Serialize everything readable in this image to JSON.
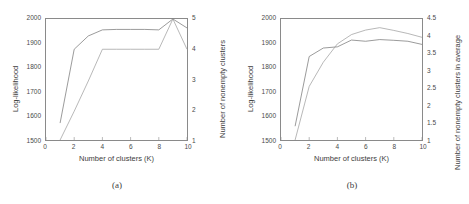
{
  "figure": {
    "panels": [
      {
        "caption": "(a)",
        "xlabel": "Number of clusters (K)",
        "ylabel_left": "Log-likelihood",
        "ylabel_right": "Number of nonempty clusters",
        "xticks": [
          "0",
          "2",
          "4",
          "6",
          "8",
          "10"
        ],
        "yticks_left": [
          "1500",
          "1600",
          "1700",
          "1800",
          "1900",
          "2000"
        ],
        "yticks_right": [
          "1",
          "2",
          "3",
          "4",
          "5"
        ]
      },
      {
        "caption": "(b)",
        "xlabel": "Number of clusters (K)",
        "ylabel_left": "Log-likelihood",
        "ylabel_right": "Number of nonempty clusters in average",
        "xticks": [
          "0",
          "2",
          "4",
          "6",
          "8",
          "10"
        ],
        "yticks_left": [
          "1500",
          "1600",
          "1700",
          "1800",
          "1900",
          "2000"
        ],
        "yticks_right": [
          "1",
          "1.5",
          "2",
          "2.5",
          "3",
          "3.5",
          "4",
          "4.5"
        ]
      }
    ]
  },
  "chart_data": [
    {
      "type": "line",
      "title": "(a)",
      "xlabel": "Number of clusters (K)",
      "ylabel": "Log-likelihood",
      "ylabel_secondary": "Number of nonempty clusters",
      "x": [
        1,
        2,
        3,
        4,
        5,
        6,
        7,
        8,
        9,
        10
      ],
      "xlim": [
        0,
        10
      ],
      "ylim": [
        1500,
        2000
      ],
      "ylim_secondary": [
        1,
        5
      ],
      "grid": false,
      "legend": "none",
      "series": [
        {
          "name": "Log-likelihood",
          "axis": "left",
          "values": [
            1570,
            1875,
            1930,
            1955,
            1957,
            1957,
            1957,
            1955,
            2000,
            1963
          ]
        },
        {
          "name": "Number of nonempty clusters",
          "axis": "right",
          "values": [
            1.0,
            1.95,
            2.95,
            4.0,
            4.0,
            4.0,
            4.0,
            4.0,
            5.0,
            4.0
          ]
        }
      ]
    },
    {
      "type": "line",
      "title": "(b)",
      "xlabel": "Number of clusters (K)",
      "ylabel": "Log-likelihood",
      "ylabel_secondary": "Number of nonempty clusters in average",
      "x": [
        1,
        2,
        3,
        4,
        5,
        6,
        7,
        8,
        9,
        10
      ],
      "xlim": [
        0,
        10
      ],
      "ylim": [
        1500,
        2000
      ],
      "ylim_secondary": [
        1,
        4.5
      ],
      "grid": false,
      "legend": "none",
      "series": [
        {
          "name": "Log-likelihood",
          "axis": "left",
          "values": [
            1557,
            1845,
            1880,
            1885,
            1913,
            1908,
            1915,
            1912,
            1908,
            1895
          ]
        },
        {
          "name": "Number of nonempty clusters in average",
          "axis": "right",
          "values": [
            1.0,
            2.55,
            3.25,
            3.78,
            4.05,
            4.18,
            4.25,
            4.17,
            4.08,
            3.97
          ]
        }
      ]
    }
  ]
}
